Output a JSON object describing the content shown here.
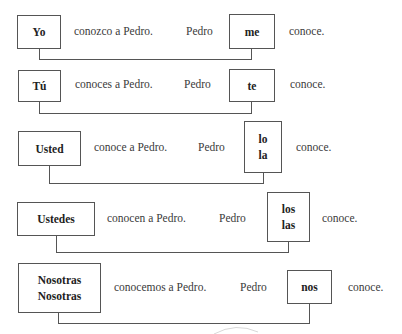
{
  "diagram": {
    "rows": [
      {
        "subject": [
          "Yo"
        ],
        "verb_phrase": "conozco a Pedro.",
        "object_subject": "Pedro",
        "pronoun": [
          "me"
        ],
        "verb": "conoce."
      },
      {
        "subject": [
          "Tú"
        ],
        "verb_phrase": "conoces a Pedro.",
        "object_subject": "Pedro",
        "pronoun": [
          "te"
        ],
        "verb": "conoce."
      },
      {
        "subject": [
          "Usted"
        ],
        "verb_phrase": "conoce a Pedro.",
        "object_subject": "Pedro",
        "pronoun": [
          "lo",
          "la"
        ],
        "verb": "conoce."
      },
      {
        "subject": [
          "Ustedes"
        ],
        "verb_phrase": "conocen a Pedro.",
        "object_subject": "Pedro",
        "pronoun": [
          "los",
          "las"
        ],
        "verb": "conoce."
      },
      {
        "subject": [
          "Nosotras",
          "Nosotras"
        ],
        "verb_phrase": "conocemos a Pedro.",
        "object_subject": "Pedro",
        "pronoun": [
          "nos"
        ],
        "verb": "conoce."
      }
    ]
  }
}
